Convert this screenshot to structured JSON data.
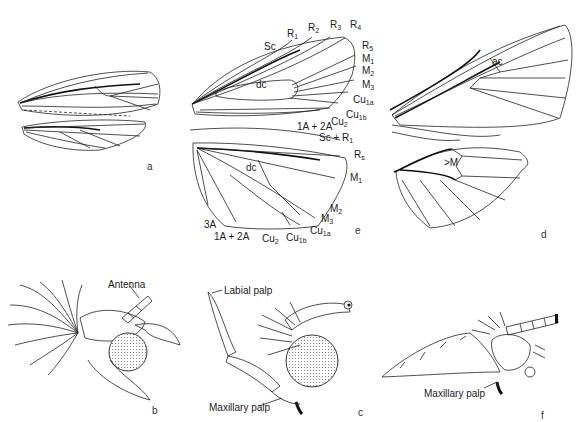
{
  "figure": {
    "panels": {
      "a": {
        "letter": "a",
        "description": "forewing and hindwing, small"
      },
      "b": {
        "letter": "b",
        "label_antenna": "Antenna"
      },
      "c": {
        "letter": "c",
        "label_labial": "Labial palp",
        "label_maxillary": "Maxillary palp"
      },
      "d": {
        "letter": "d",
        "label_ac": "ac",
        "label_m": "M"
      },
      "e": {
        "letter": "e",
        "forewing_veins": {
          "sc": "Sc",
          "r1_base": "R",
          "r1_sub": "1",
          "r2_base": "R",
          "r2_sub": "2",
          "r3_base": "R",
          "r3_sub": "3",
          "r4_base": "R",
          "r4_sub": "4",
          "r5_base": "R",
          "r5_sub": "5",
          "m1_base": "M",
          "m1_sub": "1",
          "m2_base": "M",
          "m2_sub": "2",
          "m3_base": "M",
          "m3_sub": "3",
          "cu1a_base": "Cu",
          "cu1a_sub": "1a",
          "cu1b_base": "Cu",
          "cu1b_sub": "1b",
          "cu2_base": "Cu",
          "cu2_sub": "2",
          "a12": "1A + 2A",
          "dc": "dc"
        },
        "hindwing_veins": {
          "scr1_base": "Sc + R",
          "scr1_sub": "1",
          "rs_base": "R",
          "rs_sub": "s",
          "m1_base": "M",
          "m1_sub": "1",
          "m2_base": "M",
          "m2_sub": "2",
          "m3_base": "M",
          "m3_sub": "3",
          "cu1a_base": "Cu",
          "cu1a_sub": "1a",
          "cu1b_base": "Cu",
          "cu1b_sub": "1b",
          "cu2_base": "Cu",
          "cu2_sub": "2",
          "a12": "1A + 2A",
          "a3": "3A",
          "dc": "dc"
        }
      },
      "f": {
        "letter": "f",
        "label_maxillary": "Maxillary palp"
      }
    }
  }
}
